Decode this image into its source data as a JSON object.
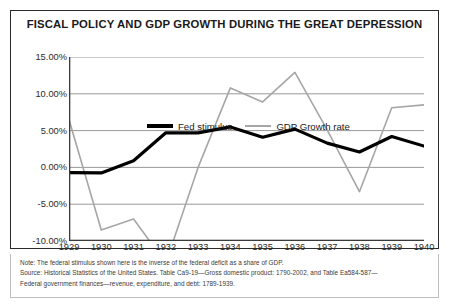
{
  "chart_frame": {
    "title": "FISCAL POLICY AND GDP GROWTH DURING THE GREAT DEPRESSION"
  },
  "legend": {
    "entries": [
      {
        "label": "Fed stimulus",
        "color": "#000000",
        "style": "thick-black-line"
      },
      {
        "label": "GDP Growth rate",
        "color": "#a6a6a6",
        "style": "thin-gray-line"
      }
    ]
  },
  "footnote": {
    "lines": [
      "Note: The federal stimulus shown here is the inverse of the federal deficit as a share of GDP.",
      "Source: Historical Statistics of the United States. Table Ca9-19—Gross domestic product: 1790-2002, and Table Ea584-587—",
      "Federal government finances—revenue, expenditure, and debt: 1789-1939."
    ]
  },
  "chart_data": {
    "type": "line",
    "title": "FISCAL POLICY AND GDP GROWTH DURING THE GREAT DEPRESSION",
    "xlabel": "",
    "ylabel": "",
    "x": [
      1929,
      1930,
      1931,
      1932,
      1933,
      1934,
      1935,
      1936,
      1937,
      1938,
      1939,
      1940
    ],
    "categories": [
      "1929",
      "1930",
      "1931",
      "1932",
      "1933",
      "1934",
      "1935",
      "1936",
      "1937",
      "1938",
      "1939",
      "1940"
    ],
    "ylim": [
      -10,
      15
    ],
    "xlim": [
      1929,
      1940
    ],
    "yticks": [
      -10,
      -5,
      0,
      5,
      10,
      15
    ],
    "ytick_labels": [
      "-10.00%",
      "-5.00%",
      "0.00%",
      "5.00%",
      "10.00%",
      "15.00%"
    ],
    "grid": true,
    "grid_axis": "y",
    "legend_position": "top-left-inside",
    "series": [
      {
        "name": "Fed stimulus",
        "color": "#000000",
        "line_width": 3.2,
        "values": [
          -0.7,
          -0.75,
          0.9,
          4.7,
          4.7,
          5.5,
          4.1,
          5.2,
          3.3,
          2.1,
          4.2,
          2.9
        ]
      },
      {
        "name": "GDP Growth rate",
        "color": "#a6a6a6",
        "line_width": 1.6,
        "clipped_below_axis": true,
        "values": [
          6.5,
          -8.5,
          -7.0,
          -13.0,
          0.0,
          10.8,
          8.9,
          12.9,
          5.1,
          -3.3,
          8.1,
          8.5
        ]
      }
    ]
  }
}
